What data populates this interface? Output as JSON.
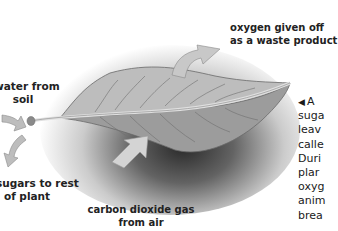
{
  "diagram": {
    "labels": {
      "oxygen_line1": "oxygen given off",
      "oxygen_line2": "as a waste product",
      "water_line1": "water from",
      "water_line2": "soil",
      "sugars_line1": "sugars to rest",
      "sugars_line2": "of plant",
      "co2_line1": "carbon dioxide gas",
      "co2_line2": "from air"
    },
    "caption": {
      "marker": "◀",
      "lines": [
        "A",
        "suga",
        "leav",
        "calle",
        "Duri",
        "plar",
        "oxyg",
        "anim",
        "brea"
      ]
    },
    "colors": {
      "background": "#ffffff",
      "leaf_top": "#b9b9b9",
      "leaf_bottom": "#9a9a9a",
      "arrow": "#c8c8c8",
      "text": "#222222"
    }
  }
}
